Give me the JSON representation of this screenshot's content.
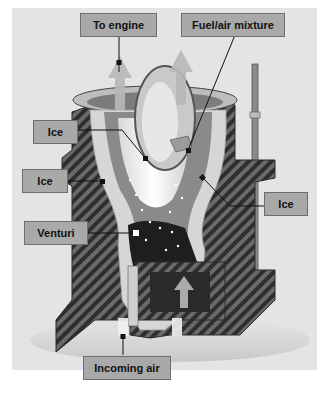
{
  "diagram": {
    "labels": {
      "to_engine": "To engine",
      "fuel_air_mixture": "Fuel/air mixture",
      "ice_throttle": "Ice",
      "ice_left_wall": "Ice",
      "ice_right_wall": "Ice",
      "venturi": "Venturi",
      "incoming_air": "Incoming air"
    },
    "colors": {
      "background": "#e4e4e4",
      "label_fill": "#a9a9a9",
      "label_border": "#6e6e6e",
      "body_dark": "#3a3a3a",
      "hatch_light": "#6a6a6a",
      "ice": "#f2f2f2",
      "airflow_arrow": "#b8b8b8"
    }
  }
}
